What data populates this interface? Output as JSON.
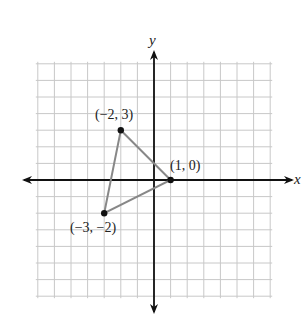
{
  "header": {
    "cropped_text": "(x, y) → (x + 3, y − 1)"
  },
  "chart_data": {
    "type": "scatter",
    "title": "",
    "xlabel": "x",
    "ylabel": "y",
    "xlim": [
      -7,
      7
    ],
    "ylim": [
      -7,
      7
    ],
    "grid": true,
    "points": [
      {
        "x": -2,
        "y": 3,
        "label": "(−2, 3)"
      },
      {
        "x": 1,
        "y": 0,
        "label": "(1, 0)"
      },
      {
        "x": -3,
        "y": -2,
        "label": "(−3, −2)"
      }
    ],
    "shape": "triangle",
    "colors": {
      "grid": "#c8c8c8",
      "axis": "#111111",
      "triangle": "#888888",
      "point": "#111111"
    }
  },
  "labels": {
    "x_axis": "x",
    "y_axis": "y",
    "p1": "(−2, 3)",
    "p2": "(1, 0)",
    "p3": "(−3, −2)"
  }
}
